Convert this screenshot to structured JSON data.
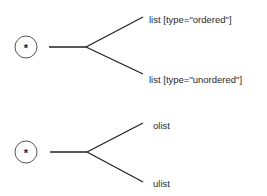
{
  "diagrams": [
    {
      "root_symbol": "*",
      "branches": [
        {
          "label": "list [type=\"ordered\"]"
        },
        {
          "label": "list [type=\"unordered\"]"
        }
      ]
    },
    {
      "root_symbol": "*",
      "branches": [
        {
          "label": "olist"
        },
        {
          "label": "ulist"
        }
      ]
    }
  ]
}
